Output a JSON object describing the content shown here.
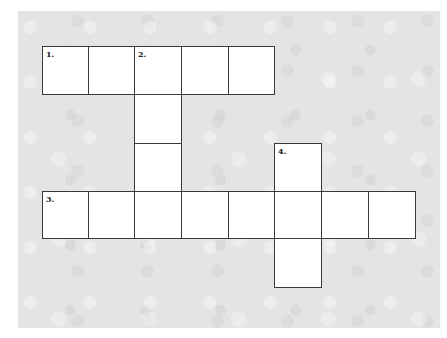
{
  "puzzle": {
    "type": "crossword",
    "cell_size": 47,
    "cells": [
      {
        "row": 0,
        "col": 0,
        "number": "1."
      },
      {
        "row": 0,
        "col": 1,
        "number": ""
      },
      {
        "row": 0,
        "col": 2,
        "number": "2."
      },
      {
        "row": 0,
        "col": 3,
        "number": ""
      },
      {
        "row": 0,
        "col": 4,
        "number": ""
      },
      {
        "row": 1,
        "col": 2,
        "number": ""
      },
      {
        "row": 2,
        "col": 2,
        "number": ""
      },
      {
        "row": 2,
        "col": 5,
        "number": "4."
      },
      {
        "row": 3,
        "col": 0,
        "number": "3."
      },
      {
        "row": 3,
        "col": 1,
        "number": ""
      },
      {
        "row": 3,
        "col": 2,
        "number": ""
      },
      {
        "row": 3,
        "col": 3,
        "number": ""
      },
      {
        "row": 3,
        "col": 4,
        "number": ""
      },
      {
        "row": 3,
        "col": 5,
        "number": ""
      },
      {
        "row": 3,
        "col": 6,
        "number": ""
      },
      {
        "row": 3,
        "col": 7,
        "number": ""
      },
      {
        "row": 4,
        "col": 5,
        "number": ""
      }
    ],
    "entries": [
      {
        "number": "1.",
        "direction": "across",
        "length": 5
      },
      {
        "number": "2.",
        "direction": "down",
        "length": 4
      },
      {
        "number": "3.",
        "direction": "across",
        "length": 8
      },
      {
        "number": "4.",
        "direction": "down",
        "length": 3
      }
    ]
  }
}
